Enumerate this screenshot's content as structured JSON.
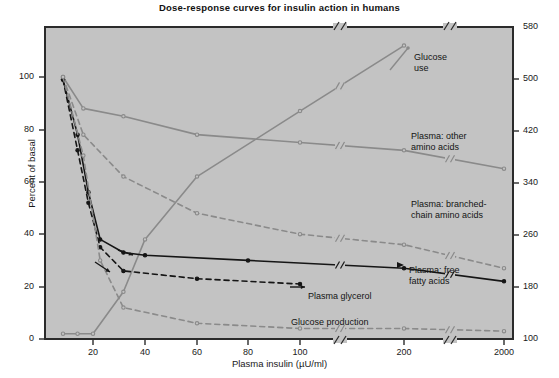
{
  "chart_data": {
    "type": "line",
    "title": "Dose-response curves for insulin action in humans",
    "xlabel": "Plasma insulin (µU/ml)",
    "ylabel": "Percent of basal",
    "ylabel_right": "",
    "xscale": "log-with-axis-breaks",
    "xticks": [
      "20",
      "40",
      "60",
      "80",
      "100",
      "200",
      "2000"
    ],
    "xtick_values": [
      20,
      40,
      60,
      80,
      100,
      200,
      2000
    ],
    "axis_breaks": [
      130,
      400
    ],
    "yticks_left": [
      "0",
      "20",
      "40",
      "60",
      "80",
      "100"
    ],
    "ytick_values_left": [
      0,
      20,
      40,
      60,
      80,
      100
    ],
    "ylim_left": [
      0,
      118
    ],
    "yticks_right": [
      "100",
      "180",
      "260",
      "340",
      "420",
      "500",
      "580"
    ],
    "ytick_values_right": [
      100,
      180,
      260,
      340,
      420,
      500,
      580
    ],
    "ylim_right": [
      100,
      580
    ],
    "grid": false,
    "legend": "inline-annotations",
    "plot_background": "#c3c3c3",
    "series": [
      {
        "name": "Glucose use",
        "label": "Glucose\nuse",
        "style": "solid",
        "color": "#8a8a8a",
        "axis": "right",
        "x": [
          10,
          14,
          20,
          30,
          40,
          60,
          100,
          200
        ],
        "values_percent": [
          2,
          2,
          2,
          18,
          38,
          62,
          87,
          112
        ]
      },
      {
        "name": "Plasma: other amino acids",
        "label": "Plasma: other\namino acids",
        "style": "solid",
        "color": "#8a8a8a",
        "axis": "left",
        "x": [
          10,
          16,
          30,
          60,
          100,
          200,
          2000
        ],
        "values_percent": [
          100,
          88,
          85,
          78,
          75,
          72,
          65
        ]
      },
      {
        "name": "Plasma: branched-chain amino acids",
        "label": "Plasma: branched-\nchain amino acids",
        "style": "dashed",
        "color": "#8a8a8a",
        "axis": "left",
        "x": [
          10,
          16,
          30,
          60,
          100,
          200,
          2000
        ],
        "values_percent": [
          100,
          78,
          62,
          48,
          40,
          36,
          27
        ]
      },
      {
        "name": "Plasma: free fatty acids",
        "label": "Plasma: free\nfatty acids",
        "style": "solid",
        "color": "#151515",
        "axis": "left",
        "x": [
          10,
          14,
          18,
          22,
          30,
          40,
          80,
          200,
          2000
        ],
        "values_percent": [
          99,
          78,
          56,
          38,
          33,
          32,
          30,
          27,
          22
        ]
      },
      {
        "name": "Plasma glycerol",
        "label": "Plasma glycerol",
        "style": "dashed",
        "color": "#151515",
        "axis": "left",
        "x": [
          10,
          14,
          18,
          22,
          30,
          60,
          100
        ],
        "values_percent": [
          99,
          72,
          52,
          35,
          26,
          23,
          21
        ]
      },
      {
        "name": "Glucose production",
        "label": "Glucose production",
        "style": "dashed",
        "color": "#8a8a8a",
        "axis": "left",
        "x": [
          10,
          16,
          22,
          30,
          60,
          100,
          200,
          2000
        ],
        "values_percent": [
          100,
          70,
          30,
          12,
          6,
          4,
          4,
          3
        ]
      }
    ]
  },
  "chart": {
    "title": "Dose-response curves for insulin action in humans",
    "xlabel": "Plasma insulin (µU/ml)",
    "ylabel": "Percent of basal",
    "xticks": [
      {
        "label": "20",
        "px": 93
      },
      {
        "label": "40",
        "px": 145
      },
      {
        "label": "60",
        "px": 197
      },
      {
        "label": "80",
        "px": 248
      },
      {
        "label": "100",
        "px": 300
      },
      {
        "label": "200",
        "px": 404
      },
      {
        "label": "2000",
        "px": 504
      }
    ],
    "yticks_left": [
      {
        "label": "100",
        "px": 77
      },
      {
        "label": "80",
        "px": 130
      },
      {
        "label": "60",
        "px": 182
      },
      {
        "label": "40",
        "px": 234
      },
      {
        "label": "20",
        "px": 287
      },
      {
        "label": "0",
        "px": 339
      }
    ],
    "yticks_right": [
      {
        "label": "580",
        "px": 27
      },
      {
        "label": "500",
        "px": 79
      },
      {
        "label": "420",
        "px": 131
      },
      {
        "label": "340",
        "px": 183
      },
      {
        "label": "260",
        "px": 235
      },
      {
        "label": "180",
        "px": 287
      },
      {
        "label": "100",
        "px": 339
      }
    ],
    "annotations": [
      {
        "name": "glucose-use",
        "text": "Glucose\nuse",
        "x": 414,
        "y": 52
      },
      {
        "name": "plasma-other-amino-acids",
        "text": "Plasma: other\namino acids",
        "x": 411,
        "y": 131
      },
      {
        "name": "plasma-branched-chain-amino-acids",
        "text": "Plasma: branched-\nchain amino acids",
        "x": 411,
        "y": 199
      },
      {
        "name": "plasma-free-fatty-acids",
        "text": "Plasma: free\nfatty acids",
        "x": 409,
        "y": 265
      },
      {
        "name": "plasma-glycerol",
        "text": "Plasma glycerol",
        "x": 308,
        "y": 291
      },
      {
        "name": "glucose-production",
        "text": "Glucose production",
        "x": 291,
        "y": 317
      }
    ]
  }
}
